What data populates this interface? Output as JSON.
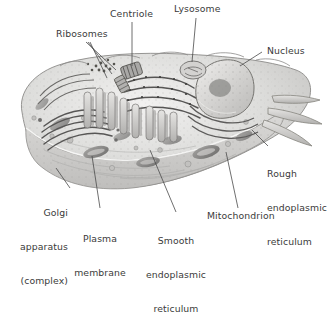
{
  "figure": {
    "style": "grayscale pencil/airbrush textbook rendering on white background",
    "colors": {
      "background": "#ffffff",
      "label_text": "#3a3a3a",
      "leader_line": "#4a4a4a",
      "cytoplasm_light": "#e3e2e0",
      "cytoplasm_mid": "#c9c8c6",
      "organelle_dark": "#6e6d6c",
      "organelle_darkest": "#4d4c4b",
      "outline": "#8b8a88"
    }
  },
  "labels": [
    {
      "id": "ribosomes",
      "text": "Ribosomes",
      "lines": [
        "Ribosomes"
      ]
    },
    {
      "id": "centriole",
      "text": "Centriole",
      "lines": [
        "Centriole"
      ]
    },
    {
      "id": "lysosome",
      "text": "Lysosome",
      "lines": [
        "Lysosome"
      ]
    },
    {
      "id": "nucleus",
      "text": "Nucleus",
      "lines": [
        "Nucleus"
      ]
    },
    {
      "id": "rough-er",
      "text": "Rough endoplasmic reticulum",
      "lines": [
        "Rough",
        "endoplasmic",
        "reticulum"
      ]
    },
    {
      "id": "mitochondrion",
      "text": "Mitochondrion",
      "lines": [
        "Mitochondrion"
      ]
    },
    {
      "id": "smooth-er",
      "text": "Smooth endoplasmic reticulum",
      "lines": [
        "Smooth",
        "endoplasmic",
        "reticulum"
      ]
    },
    {
      "id": "plasma-membrane",
      "text": "Plasma membrane",
      "lines": [
        "Plasma",
        "membrane"
      ]
    },
    {
      "id": "golgi",
      "text": "Golgi apparatus (complex)",
      "lines": [
        "Golgi",
        "apparatus",
        "(complex)"
      ]
    }
  ],
  "label_text": {
    "ribosomes": "Ribosomes",
    "centriole": "Centriole",
    "lysosome": "Lysosome",
    "nucleus": "Nucleus",
    "rough_er_l1": "Rough",
    "rough_er_l2": "endoplasmic",
    "rough_er_l3": "reticulum",
    "mitochondrion": "Mitochondrion",
    "smooth_er_l1": "Smooth",
    "smooth_er_l2": "endoplasmic",
    "smooth_er_l3": "reticulum",
    "plasma_l1": "Plasma",
    "plasma_l2": "membrane",
    "golgi_l1": "Golgi",
    "golgi_l2": "apparatus",
    "golgi_l3": "(complex)"
  }
}
